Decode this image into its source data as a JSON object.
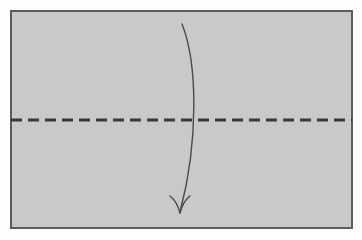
{
  "figure": {
    "title": "Origami fold step diagram",
    "caption": "Valley fold the sheet in half along the horizontal crease; the arrow shows the top edge folding down to meet the bottom edge.",
    "background_color": "#fdfdfd"
  },
  "paper": {
    "name": "paper-sheet",
    "label": "Paper sheet",
    "fill_color": "#c9c9c9",
    "border_color": "#5b5b5b",
    "border_width": 2,
    "x": 11,
    "y": 11,
    "width": 341,
    "height": 217
  },
  "fold_line": {
    "name": "valley-fold-crease",
    "label": "Valley fold crease line",
    "style": "dashed",
    "color": "#3a3a3a",
    "stroke_width": 3,
    "dash_length": 11,
    "gap_length": 6,
    "y": 120,
    "x_start": 11,
    "x_end": 352
  },
  "fold_arrow": {
    "name": "fold-direction-arrow",
    "label": "Fold direction arrow",
    "color": "#4a4a4a",
    "stroke_width": 1.4,
    "start_x": 182,
    "start_y": 24,
    "tip_x": 180,
    "tip_y": 213,
    "control_x": 199,
    "control_y": 120,
    "arrowhead_style": "open-barb"
  },
  "colors": {
    "paper_fill": "#c9c9c9",
    "paper_border": "#5b5b5b",
    "crease": "#3a3a3a",
    "arrow": "#4a4a4a",
    "page_background": "#fdfdfd"
  }
}
